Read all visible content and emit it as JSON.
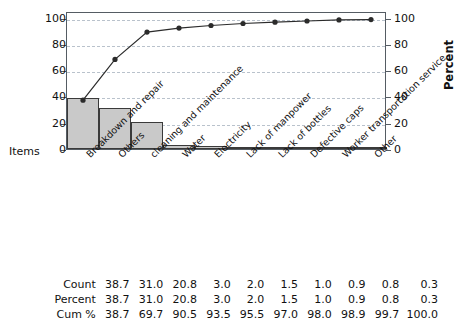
{
  "chart_data": {
    "type": "bar",
    "title": "",
    "xlabel": "Items",
    "ylabel": "",
    "y2label": "Percent",
    "categories": [
      "Breakdown and repair",
      "Others",
      "cleaning and maintenance",
      "Water",
      "Electricity",
      "Lack of manpower",
      "Lack of bottles",
      "Defective caps",
      "Worker transportation service",
      "Other"
    ],
    "series": [
      {
        "name": "Count",
        "type": "bar",
        "values": [
          38.7,
          31.0,
          20.8,
          3.0,
          2.0,
          1.5,
          1.0,
          0.9,
          0.8,
          0.3
        ]
      },
      {
        "name": "Cum %",
        "type": "line",
        "values": [
          38.7,
          69.7,
          90.5,
          93.5,
          95.5,
          97.0,
          98.0,
          98.9,
          99.7,
          100.0
        ]
      }
    ],
    "ylim": [
      0,
      105
    ],
    "y2lim": [
      0,
      105
    ],
    "yticks": [
      0,
      20,
      40,
      60,
      80,
      100
    ],
    "y2ticks": [
      0,
      20,
      40,
      60,
      80,
      100
    ],
    "ytick_labels": [
      "0",
      "20",
      "40",
      "60",
      "80",
      "100"
    ],
    "y2tick_labels": [
      "0",
      "20",
      "40",
      "60",
      "80",
      "100"
    ],
    "grid": true,
    "legend": "none",
    "bar_color": "#c9c9c9",
    "bar_edge_color": "#3a3a3a",
    "line_color": "#2b2b2b",
    "grid_color": "#b9c2cc",
    "frame_color": "#555c63"
  },
  "axes": {
    "left_ticks": [
      "100",
      "80",
      "60",
      "40",
      "20",
      "0"
    ],
    "right_ticks": [
      "100",
      "80",
      "60",
      "40",
      "20",
      "0"
    ],
    "percent_label": "Percent",
    "items_label": "Items"
  },
  "table": {
    "rows": [
      {
        "label": "Count",
        "values": [
          "38.7",
          "31.0",
          "20.8",
          "3.0",
          "2.0",
          "1.5",
          "1.0",
          "0.9",
          "0.8",
          "0.3"
        ]
      },
      {
        "label": "Percent",
        "values": [
          "38.7",
          "31.0",
          "20.8",
          "3.0",
          "2.0",
          "1.5",
          "1.0",
          "0.9",
          "0.8",
          "0.3"
        ]
      },
      {
        "label": "Cum %",
        "values": [
          "38.7",
          "69.7",
          "90.5",
          "93.5",
          "95.5",
          "97.0",
          "98.0",
          "98.9",
          "99.7",
          "100.0"
        ]
      }
    ]
  }
}
